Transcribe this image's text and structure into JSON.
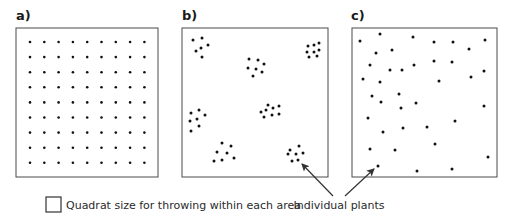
{
  "panels": [
    {
      "label": "a)",
      "pattern": "uniform"
    },
    {
      "label": "b)",
      "pattern": "clumped"
    },
    {
      "label": "c)",
      "pattern": "random"
    }
  ],
  "legend": {
    "quadrat_label": "Quadrat size for throwing within each area",
    "plants_label": "Individual plants"
  },
  "colors": {
    "line": "#4a4a4a",
    "dot": "#111111"
  },
  "dots": {
    "a_grid": {
      "cols": 9,
      "rows": 9,
      "x0": 30,
      "y0": 42,
      "dx": 14.3,
      "dy": 15.1
    },
    "b": [
      [
        193,
        40
      ],
      [
        202,
        38
      ],
      [
        208,
        45
      ],
      [
        201,
        48
      ],
      [
        196,
        51
      ],
      [
        202,
        57
      ],
      [
        308,
        46
      ],
      [
        314,
        45
      ],
      [
        319,
        43
      ],
      [
        307,
        52
      ],
      [
        314,
        52
      ],
      [
        319,
        50
      ],
      [
        309,
        57
      ],
      [
        317,
        56
      ],
      [
        249,
        59
      ],
      [
        258,
        60
      ],
      [
        264,
        64
      ],
      [
        248,
        68
      ],
      [
        256,
        69
      ],
      [
        262,
        72
      ],
      [
        253,
        76
      ],
      [
        199,
        110
      ],
      [
        191,
        113
      ],
      [
        205,
        115
      ],
      [
        197,
        119
      ],
      [
        190,
        121
      ],
      [
        199,
        126
      ],
      [
        191,
        131
      ],
      [
        268,
        105
      ],
      [
        273,
        108
      ],
      [
        279,
        106
      ],
      [
        261,
        112
      ],
      [
        266,
        110
      ],
      [
        272,
        115
      ],
      [
        279,
        114
      ],
      [
        264,
        117
      ],
      [
        222,
        143
      ],
      [
        231,
        146
      ],
      [
        217,
        152
      ],
      [
        227,
        153
      ],
      [
        234,
        158
      ],
      [
        222,
        160
      ],
      [
        214,
        161
      ],
      [
        299,
        146
      ],
      [
        290,
        150
      ],
      [
        288,
        154
      ],
      [
        296,
        154
      ],
      [
        303,
        153
      ],
      [
        292,
        161
      ],
      [
        298,
        160
      ]
    ],
    "c": [
      [
        360,
        41
      ],
      [
        380,
        34
      ],
      [
        413,
        37
      ],
      [
        434,
        42
      ],
      [
        453,
        42
      ],
      [
        485,
        40
      ],
      [
        469,
        49
      ],
      [
        376,
        53
      ],
      [
        392,
        50
      ],
      [
        370,
        65
      ],
      [
        390,
        70
      ],
      [
        402,
        70
      ],
      [
        414,
        65
      ],
      [
        434,
        61
      ],
      [
        452,
        62
      ],
      [
        484,
        71
      ],
      [
        363,
        79
      ],
      [
        380,
        82
      ],
      [
        439,
        81
      ],
      [
        471,
        77
      ],
      [
        372,
        96
      ],
      [
        399,
        94
      ],
      [
        381,
        102
      ],
      [
        401,
        108
      ],
      [
        416,
        103
      ],
      [
        484,
        106
      ],
      [
        368,
        118
      ],
      [
        455,
        121
      ],
      [
        383,
        132
      ],
      [
        403,
        128
      ],
      [
        427,
        127
      ],
      [
        370,
        149
      ],
      [
        395,
        150
      ],
      [
        435,
        144
      ],
      [
        488,
        157
      ],
      [
        378,
        166
      ],
      [
        417,
        171
      ],
      [
        452,
        169
      ]
    ]
  }
}
